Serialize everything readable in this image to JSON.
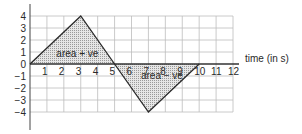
{
  "chart_data": {
    "type": "line",
    "title": "",
    "xlabel": "time (in s)",
    "ylabel": "",
    "xlim": [
      0,
      12
    ],
    "ylim": [
      -4,
      4
    ],
    "grid": true,
    "x_ticks": [
      "1",
      "2",
      "3",
      "4",
      "5",
      "6",
      "7",
      "8",
      "9",
      "10",
      "11",
      "12"
    ],
    "y_ticks": [
      "4",
      "3",
      "2",
      "1",
      "0",
      "−1",
      "−2",
      "−3",
      "−4"
    ],
    "y_tick_values": [
      4,
      3,
      2,
      1,
      0,
      -1,
      -2,
      -3,
      -4
    ],
    "series": [
      {
        "name": "velocity",
        "x": [
          0,
          3,
          5,
          7,
          10
        ],
        "y": [
          0,
          4,
          0,
          -4,
          0
        ]
      }
    ],
    "shaded_regions": [
      {
        "label": "area + ve",
        "x": [
          0,
          3,
          5
        ],
        "y": [
          0,
          4,
          0
        ]
      },
      {
        "label": "area − ve",
        "x": [
          5,
          7,
          10
        ],
        "y": [
          0,
          -4,
          0
        ]
      }
    ],
    "annotations": [
      {
        "text": "area + ve",
        "x": 2.8,
        "y": 0.9
      },
      {
        "text": "area − ve",
        "x": 7.8,
        "y": -0.9
      }
    ]
  }
}
